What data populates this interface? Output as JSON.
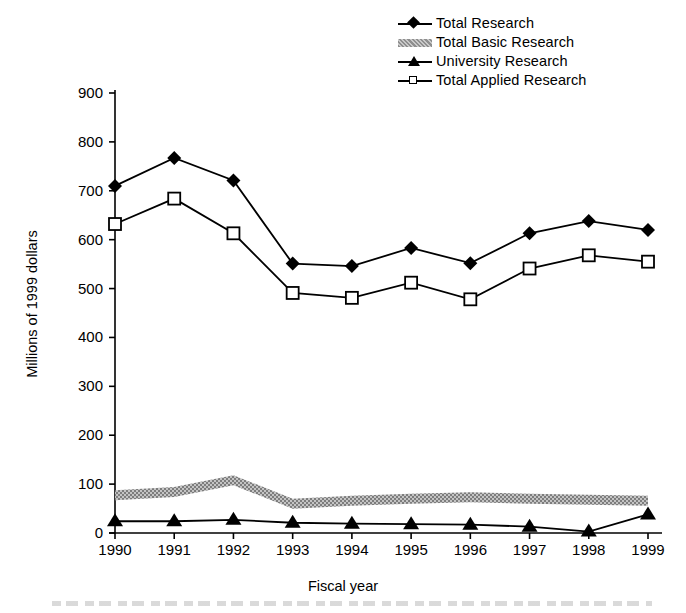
{
  "chart_data": {
    "type": "line",
    "title": "",
    "xlabel": "Fiscal year",
    "ylabel": "Millions of 1999 dollars",
    "categories": [
      "1990",
      "1991",
      "1992",
      "1993",
      "1994",
      "1995",
      "1996",
      "1997",
      "1998",
      "1999"
    ],
    "x": [
      1990,
      1991,
      1992,
      1993,
      1994,
      1995,
      1996,
      1997,
      1998,
      1999
    ],
    "ylim": [
      0,
      900
    ],
    "yticks": [
      0,
      100,
      200,
      300,
      400,
      500,
      600,
      700,
      800,
      900
    ],
    "grid": false,
    "legend_position": "top-right",
    "series": [
      {
        "name": "Total Research",
        "marker": "filled-diamond",
        "color": "#000000",
        "values": [
          710,
          767,
          721,
          551,
          546,
          583,
          552,
          613,
          638,
          620
        ]
      },
      {
        "name": "Total Basic Research",
        "marker": "gray-band",
        "color": "#9a9a9a",
        "values": [
          77,
          84,
          108,
          60,
          66,
          70,
          73,
          70,
          68,
          66
        ]
      },
      {
        "name": "University Research",
        "marker": "filled-triangle",
        "color": "#000000",
        "values": [
          24,
          24,
          27,
          21,
          19,
          18,
          17,
          13,
          3,
          38
        ]
      },
      {
        "name": "Total Applied Research",
        "marker": "open-square",
        "color": "#000000",
        "values": [
          632,
          684,
          613,
          491,
          481,
          512,
          478,
          541,
          568,
          555
        ]
      }
    ]
  },
  "legend": {
    "items": [
      {
        "label": "Total Research",
        "key": "filled-diamond-marker"
      },
      {
        "label": "Total Basic Research",
        "key": "gray-band-marker"
      },
      {
        "label": "University Research",
        "key": "filled-triangle-marker"
      },
      {
        "label": "Total Applied Research",
        "key": "open-square-marker"
      }
    ]
  },
  "axes": {
    "y_title": "Millions of 1999 dollars",
    "x_title": "Fiscal year",
    "y_ticks": [
      "900",
      "800",
      "700",
      "600",
      "500",
      "400",
      "300",
      "200",
      "100",
      "0"
    ],
    "x_ticks": [
      "1990",
      "1991",
      "1992",
      "1993",
      "1994",
      "1995",
      "1996",
      "1997",
      "1998",
      "1999"
    ]
  },
  "colors": {
    "axis": "#000000",
    "series_line": "#000000",
    "basic_research_band": "#9a9a9a",
    "background": "#ffffff"
  }
}
